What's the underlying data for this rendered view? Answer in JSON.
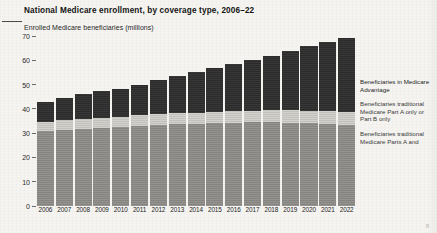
{
  "title": "National Medicare enrollment, by coverage type, 2006–22",
  "subtitle": "Enrolled Medicare beneficiaries (millions)",
  "page_number": "8",
  "colors": {
    "medicare_advantage": "#2d2d2d",
    "part_a_or_b_only": "#c9c7c2",
    "parts_a_and_b": "#8d8b87",
    "page_background": "#f5f4f1"
  },
  "legend": {
    "items": [
      {
        "label": "Beneficiaries in Medicare Advantage",
        "color": "#2d2d2d"
      },
      {
        "label": "Beneficiaries traditional Medicare Part A only or Part B only",
        "color": "#c9c7c2"
      },
      {
        "label": "Beneficiaries traditional Medicare Parts A and",
        "color": "#8d8b87"
      }
    ]
  },
  "chart_data": {
    "type": "bar",
    "title": "National Medicare enrollment, by coverage type, 2006–22",
    "xlabel": "",
    "ylabel": "Enrolled Medicare beneficiaries (millions)",
    "ylim": [
      0,
      70
    ],
    "yticks": [
      0,
      10,
      20,
      30,
      40,
      50,
      60,
      70
    ],
    "grid": false,
    "legend_position": "right",
    "stacked": true,
    "categories": [
      "2006",
      "2007",
      "2008",
      "2009",
      "2010",
      "2011",
      "2012",
      "2013",
      "2014",
      "2015",
      "2016",
      "2017",
      "2018",
      "2019",
      "2020",
      "2021",
      "2022"
    ],
    "series": [
      {
        "name": "Beneficiaries traditional Medicare Parts A and B",
        "color": "#8d8b87",
        "values": [
          31.0,
          31.4,
          31.8,
          32.2,
          32.6,
          33.0,
          33.3,
          33.6,
          33.9,
          34.1,
          34.3,
          34.4,
          34.4,
          34.3,
          34.1,
          33.8,
          33.4
        ]
      },
      {
        "name": "Beneficiaries traditional Medicare Part A only or Part B only",
        "color": "#c9c7c2",
        "values": [
          3.8,
          3.9,
          4.0,
          4.1,
          4.2,
          4.3,
          4.4,
          4.5,
          4.6,
          4.7,
          4.8,
          4.9,
          5.0,
          5.1,
          5.2,
          5.3,
          5.4
        ]
      },
      {
        "name": "Beneficiaries in Medicare Advantage",
        "color": "#2d2d2d",
        "values": [
          8.2,
          9.2,
          10.2,
          11.0,
          11.6,
          12.7,
          14.0,
          15.4,
          16.8,
          17.9,
          19.3,
          20.7,
          22.4,
          24.3,
          26.6,
          28.6,
          30.3
        ]
      }
    ],
    "totals": [
      43.0,
      44.5,
      46.0,
      47.3,
      48.4,
      50.0,
      51.7,
      53.5,
      55.3,
      56.7,
      58.4,
      60.0,
      61.8,
      63.7,
      65.9,
      67.7,
      69.1
    ]
  }
}
